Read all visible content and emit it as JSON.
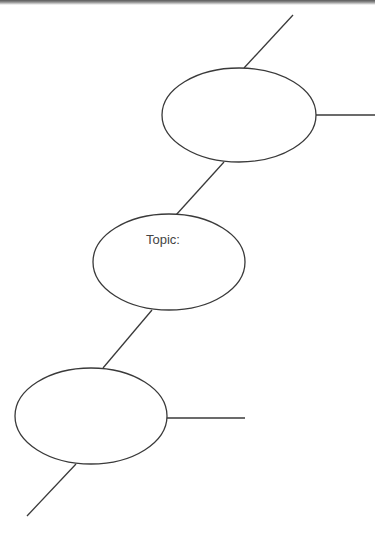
{
  "diagram": {
    "type": "chain-of-ovals organizer",
    "stroke_color": "#3a3a3a",
    "nodes": [
      {
        "id": "oval-top",
        "label": "",
        "cx": 239,
        "cy": 115,
        "rx": 77,
        "ry": 47
      },
      {
        "id": "oval-topic",
        "label": "Topic:",
        "cx": 169,
        "cy": 262,
        "rx": 76,
        "ry": 48
      },
      {
        "id": "oval-bottom",
        "label": "",
        "cx": 91,
        "cy": 416,
        "rx": 76,
        "ry": 48
      }
    ],
    "connectors": [
      {
        "from": "top-edge",
        "to": "oval-top",
        "x1": 293,
        "y1": 15,
        "x2": 244,
        "y2": 68
      },
      {
        "from": "oval-top",
        "to": "right-edge",
        "x1": 316,
        "y1": 115,
        "x2": 375,
        "y2": 115
      },
      {
        "from": "oval-top",
        "to": "oval-topic",
        "x1": 224,
        "y1": 162,
        "x2": 176,
        "y2": 215
      },
      {
        "from": "oval-topic",
        "to": "oval-bottom",
        "x1": 152,
        "y1": 310,
        "x2": 103,
        "y2": 368
      },
      {
        "from": "oval-bottom",
        "to": "right-branch",
        "x1": 167,
        "y1": 418,
        "x2": 245,
        "y2": 418
      },
      {
        "from": "oval-bottom",
        "to": "bottom-end",
        "x1": 76,
        "y1": 464,
        "x2": 27,
        "y2": 516
      }
    ]
  },
  "topic_label": "Topic:"
}
